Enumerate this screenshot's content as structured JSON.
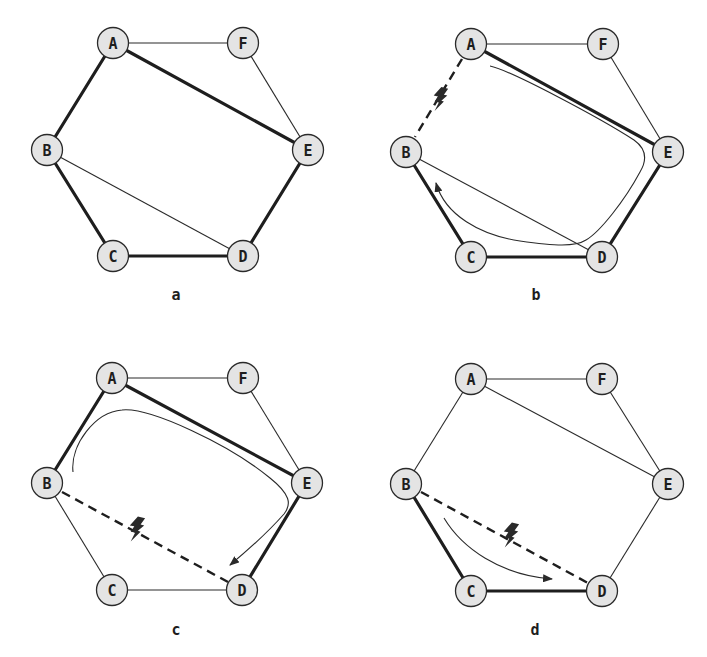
{
  "figure": {
    "node_labels": [
      "A",
      "B",
      "C",
      "D",
      "E",
      "F"
    ],
    "colors": {
      "node_fill": "#e4e4e4",
      "stroke": "#1e1e1e"
    },
    "panels": [
      {
        "id": "a",
        "caption": "a",
        "thick_edges": [
          [
            "A",
            "B"
          ],
          [
            "B",
            "C"
          ],
          [
            "C",
            "D"
          ],
          [
            "D",
            "E"
          ],
          [
            "E",
            "A"
          ]
        ],
        "thin_edges": [
          [
            "A",
            "F"
          ],
          [
            "F",
            "E"
          ],
          [
            "B",
            "D"
          ]
        ],
        "failed_edges": [],
        "reroute": null
      },
      {
        "id": "b",
        "caption": "b",
        "thick_edges": [
          [
            "A",
            "E"
          ],
          [
            "E",
            "D"
          ],
          [
            "D",
            "C"
          ],
          [
            "C",
            "B"
          ]
        ],
        "thin_edges": [
          [
            "A",
            "F"
          ],
          [
            "F",
            "E"
          ],
          [
            "B",
            "D"
          ]
        ],
        "failed_edges": [
          [
            "A",
            "B"
          ]
        ],
        "reroute": "A → E → D → C → B"
      },
      {
        "id": "c",
        "caption": "c",
        "thick_edges": [
          [
            "B",
            "A"
          ],
          [
            "A",
            "E"
          ],
          [
            "E",
            "D"
          ]
        ],
        "thin_edges": [
          [
            "A",
            "F"
          ],
          [
            "F",
            "E"
          ],
          [
            "B",
            "C"
          ],
          [
            "C",
            "D"
          ]
        ],
        "failed_edges": [
          [
            "B",
            "D"
          ]
        ],
        "reroute": "B → A → E → D"
      },
      {
        "id": "d",
        "caption": "d",
        "thick_edges": [
          [
            "B",
            "C"
          ],
          [
            "C",
            "D"
          ]
        ],
        "thin_edges": [
          [
            "A",
            "F"
          ],
          [
            "F",
            "E"
          ],
          [
            "A",
            "B"
          ],
          [
            "A",
            "E"
          ],
          [
            "E",
            "D"
          ]
        ],
        "failed_edges": [
          [
            "B",
            "D"
          ]
        ],
        "reroute": "B → C → D"
      }
    ]
  }
}
